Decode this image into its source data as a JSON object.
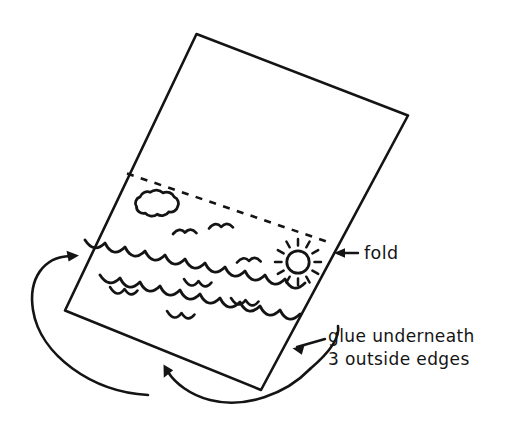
{
  "diagram": {
    "title": "Folded paper seascape card",
    "background_color": "#ffffff",
    "ink_color": "#141414",
    "labels": {
      "fold": "fold",
      "glue_line1": "glue underneath",
      "glue_line2": "3 outside edges"
    },
    "icons": {
      "fold_arrow": "arrow-left-icon",
      "glue_arrow": "arrow-left-icon",
      "flip_arrow_left": "curved-arrow-icon",
      "flip_arrow_bottom": "curved-arrow-icon",
      "sun": "sun-icon",
      "cloud": "cloud-icon",
      "bird": "bird-icon",
      "wave": "wave-icon"
    },
    "paper": {
      "shape": "tilted-rectangle",
      "corners": [
        {
          "name": "top",
          "x": 196,
          "y": 34
        },
        {
          "name": "right",
          "x": 408,
          "y": 115
        },
        {
          "name": "bottom",
          "x": 261,
          "y": 390
        },
        {
          "name": "left",
          "x": 65,
          "y": 310
        }
      ]
    },
    "fold_line": {
      "style": "dashed",
      "from": {
        "x": 127,
        "y": 173
      },
      "to": {
        "x": 331,
        "y": 243
      }
    },
    "scene_elements": {
      "cloud": {
        "cx": 155,
        "cy": 207,
        "w": 52,
        "h": 30
      },
      "sun": {
        "cx": 298,
        "cy": 262,
        "r": 11,
        "rays": 12
      },
      "birds": [
        {
          "x": 185,
          "y": 233
        },
        {
          "x": 221,
          "y": 227
        },
        {
          "x": 249,
          "y": 261
        }
      ],
      "waves_small": [
        {
          "x": 122,
          "y": 289
        },
        {
          "x": 179,
          "y": 313
        },
        {
          "x": 196,
          "y": 281
        },
        {
          "x": 243,
          "y": 300
        }
      ]
    }
  }
}
